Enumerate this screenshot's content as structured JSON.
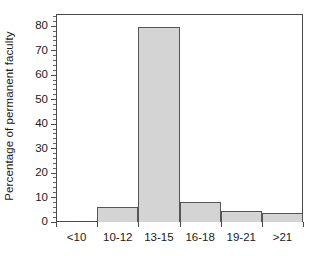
{
  "chart_data": {
    "type": "bar",
    "title": "",
    "subtitle": "",
    "xlabel": "",
    "ylabel": "Percentage of permanent faculty",
    "categories": [
      "<10",
      "10-12",
      "13-15",
      "16-18",
      "19-21",
      ">21"
    ],
    "values": [
      0,
      6,
      79.5,
      8,
      4.3,
      3.5
    ],
    "series": [
      {
        "name": "Percentage of permanent faculty",
        "values": [
          0,
          6,
          79.5,
          8,
          4.3,
          3.5
        ]
      }
    ],
    "ylim": [
      0,
      85
    ],
    "xlim": [
      0,
      6
    ],
    "y_ticks": [
      0,
      10,
      20,
      30,
      40,
      50,
      60,
      70,
      80
    ],
    "y_tick_labels": [
      "0",
      "10",
      "20",
      "30",
      "40",
      "50",
      "60",
      "70",
      "80"
    ],
    "y_minor_tick_interval": 2,
    "grid": false,
    "legend": false,
    "legend_position": "none",
    "bar_fill_color": "#d4d4d4",
    "bar_edge_color": "#555555",
    "axis_color": "#4a4a4a",
    "text_color": "#1a1a1a",
    "background_color": "#ffffff",
    "annotations": []
  },
  "axes": {
    "y_title": "Percentage of permanent faculty"
  }
}
